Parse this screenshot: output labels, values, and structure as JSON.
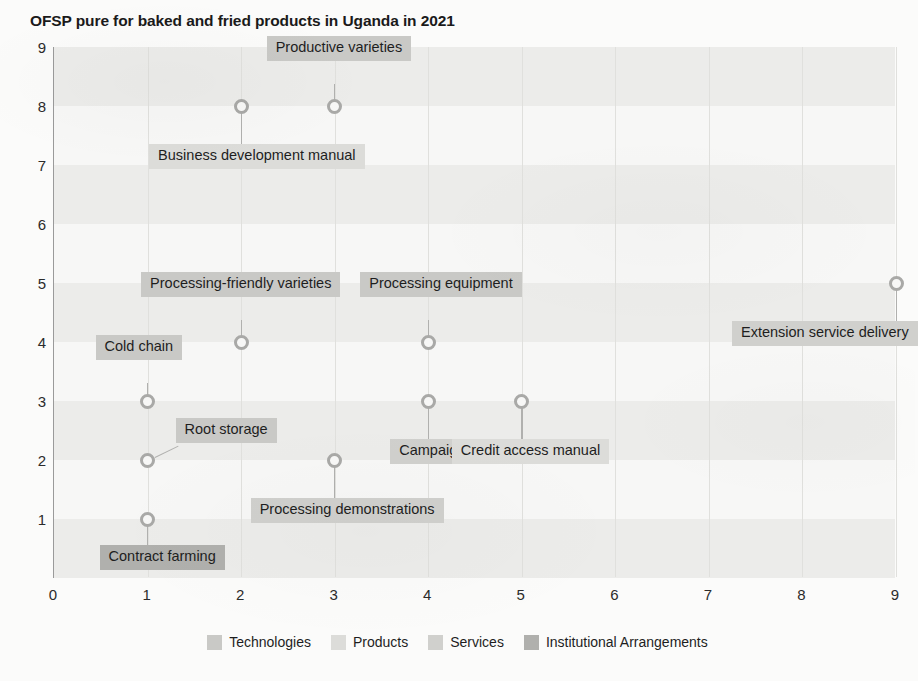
{
  "chart_data": {
    "type": "scatter",
    "title": "OFSP pure for baked and fried products in Uganda in 2021",
    "xlabel": "",
    "ylabel": "",
    "xlim": [
      0,
      9
    ],
    "ylim": [
      0,
      9
    ],
    "xticks": [
      "0",
      "1",
      "2",
      "3",
      "4",
      "5",
      "6",
      "7",
      "8",
      "9"
    ],
    "yticks": [
      "1",
      "2",
      "3",
      "4",
      "5",
      "6",
      "7",
      "8",
      "9"
    ],
    "grid": "horizontal-bands-and-vertical-lines",
    "legend_position": "bottom-center",
    "points": [
      {
        "label": "Contract farming",
        "x": 1,
        "y": 1,
        "category": "Institutional Arrangements"
      },
      {
        "label": "Root storage",
        "x": 1,
        "y": 2,
        "category": "Technologies"
      },
      {
        "label": "Cold chain",
        "x": 1,
        "y": 3,
        "category": "Technologies"
      },
      {
        "label": "Processing-friendly varieties",
        "x": 2,
        "y": 4,
        "category": "Technologies"
      },
      {
        "label": "Business development manual",
        "x": 2,
        "y": 8,
        "category": "Products"
      },
      {
        "label": "Processing demonstrations",
        "x": 3,
        "y": 2,
        "category": "Services"
      },
      {
        "label": "Productive varieties",
        "x": 3,
        "y": 8,
        "category": "Technologies"
      },
      {
        "label": "Campaign",
        "x": 4,
        "y": 3,
        "category": "Services"
      },
      {
        "label": "Processing equipment",
        "x": 4,
        "y": 4,
        "category": "Technologies"
      },
      {
        "label": "Credit access manual",
        "x": 5,
        "y": 3,
        "category": "Products"
      },
      {
        "label": "Extension service delivery",
        "x": 9,
        "y": 5,
        "category": "Services"
      }
    ],
    "legend": [
      {
        "name": "Technologies",
        "color": "#c9c9c6"
      },
      {
        "name": "Products",
        "color": "#dcdcd9"
      },
      {
        "name": "Services",
        "color": "#d0d0cd"
      },
      {
        "name": "Institutional Arrangements",
        "color": "#b0b0ad"
      }
    ]
  },
  "labels_layout": [
    {
      "point": 0,
      "text": "Contract farming",
      "anchor": "below-left",
      "dx": -48,
      "dy": 26
    },
    {
      "point": 1,
      "text": "Root storage",
      "anchor": "right-diag",
      "dx": 28,
      "dy": -16
    },
    {
      "point": 2,
      "text": "Cold chain",
      "anchor": "above-left",
      "dx": -52,
      "dy": -40
    },
    {
      "point": 3,
      "text": "Processing-friendly varieties",
      "anchor": "above",
      "dx": -100,
      "dy": -44
    },
    {
      "point": 4,
      "text": "Business development manual",
      "anchor": "below",
      "dx": -92,
      "dy": 38
    },
    {
      "point": 5,
      "text": "Processing demonstrations",
      "anchor": "below",
      "dx": -84,
      "dy": 38
    },
    {
      "point": 6,
      "text": "Productive varieties",
      "anchor": "above",
      "dx": -68,
      "dy": -44
    },
    {
      "point": 7,
      "text": "Campaign",
      "anchor": "below",
      "dx": -38,
      "dy": 38
    },
    {
      "point": 8,
      "text": "Processing equipment",
      "anchor": "above",
      "dx": -68,
      "dy": -44
    },
    {
      "point": 9,
      "text": "Credit access manual",
      "anchor": "below",
      "dx": -70,
      "dy": 38
    },
    {
      "point": 10,
      "text": "Extension service delivery",
      "anchor": "below-left",
      "dx": -164,
      "dy": 38
    }
  ]
}
